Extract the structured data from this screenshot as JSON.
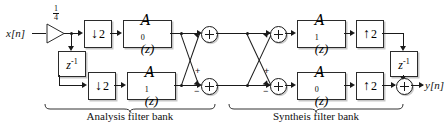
{
  "diagram": {
    "input_label": "x[n]",
    "output_label": "y[n]",
    "gain": {
      "numerator": "1",
      "denominator": "4"
    },
    "captions": {
      "analysis": "Analysis filter bank",
      "synthesis": "Syntheis filter bank"
    },
    "blocks": {
      "downsample_top": {
        "arrow": "↓",
        "factor": "2"
      },
      "downsample_bottom": {
        "arrow": "↓",
        "factor": "2"
      },
      "upsample_top": {
        "arrow": "↑",
        "factor": "2"
      },
      "upsample_bottom": {
        "arrow": "↑",
        "factor": "2"
      },
      "allpass_a0_analysis": {
        "name": "A",
        "sub": "0",
        "arg": "(z)"
      },
      "allpass_a1_analysis": {
        "name": "A",
        "sub": "1",
        "arg": "(z)"
      },
      "allpass_a1_synthesis": {
        "name": "A",
        "sub": "1",
        "arg": "(z)"
      },
      "allpass_a0_synthesis": {
        "name": "A",
        "sub": "0",
        "arg": "(z)"
      },
      "delay_analysis": {
        "base": "z",
        "exp": "-1"
      },
      "delay_synthesis": {
        "base": "z",
        "exp": "-1"
      }
    },
    "adders": {
      "analysis_top": {
        "signs": []
      },
      "analysis_bottom": {
        "plus": "+",
        "minus": "−"
      },
      "synthesis_top": {
        "signs": []
      },
      "synthesis_bottom": {
        "plus": "+",
        "minus": "−"
      },
      "output": {
        "signs": []
      }
    },
    "colors": {
      "line": "#1a1a1a",
      "box_border": "#2b2b2b",
      "background": "#ffffff"
    }
  }
}
